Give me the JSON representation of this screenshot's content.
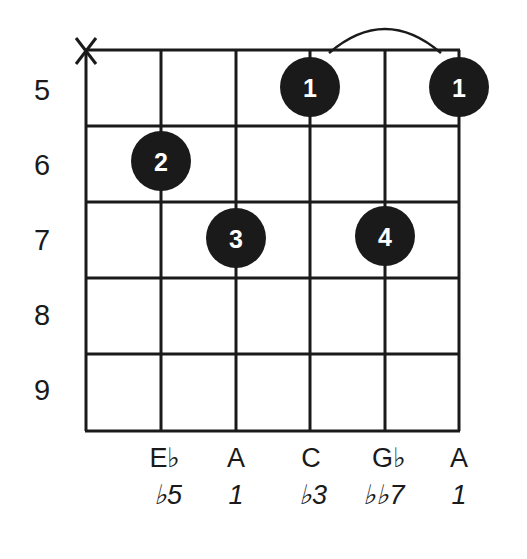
{
  "diagram": {
    "type": "guitar-chord-diagram",
    "colors": {
      "ink": "#1a1a1a",
      "background": "#ffffff",
      "dot_text": "#ffffff"
    },
    "strings": 6,
    "fret_numbers": [
      "5",
      "6",
      "7",
      "8",
      "9"
    ],
    "muted_strings": [
      {
        "string": 1,
        "symbol": "X"
      }
    ],
    "barre": {
      "from_string": 4,
      "to_string": 6,
      "fret": "5"
    },
    "fingers": [
      {
        "string": 4,
        "fret": "5",
        "label": "1"
      },
      {
        "string": 6,
        "fret": "5",
        "label": "1"
      },
      {
        "string": 2,
        "fret": "6",
        "label": "2"
      },
      {
        "string": 3,
        "fret": "7",
        "label": "3"
      },
      {
        "string": 5,
        "fret": "7",
        "label": "4"
      }
    ],
    "notes": [
      {
        "string": 2,
        "label": "E♭"
      },
      {
        "string": 3,
        "label": "A"
      },
      {
        "string": 4,
        "label": "C"
      },
      {
        "string": 5,
        "label": "G♭"
      },
      {
        "string": 6,
        "label": "A"
      }
    ],
    "intervals": [
      {
        "string": 2,
        "label": "♭5"
      },
      {
        "string": 3,
        "label": "1"
      },
      {
        "string": 4,
        "label": "♭3"
      },
      {
        "string": 5,
        "label": "♭♭7"
      },
      {
        "string": 6,
        "label": "1"
      }
    ]
  }
}
